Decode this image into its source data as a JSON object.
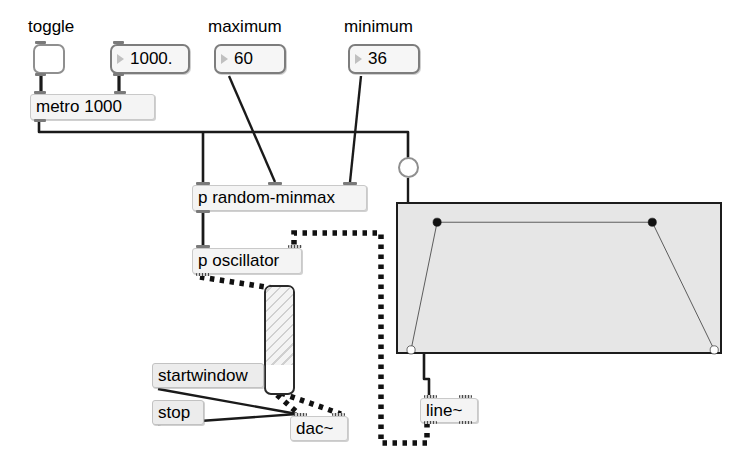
{
  "patch": {
    "title": "Max patch - random oscillator with envelope",
    "width": 744,
    "height": 471,
    "background": "#ffffff"
  },
  "comments": [
    {
      "name": "comment-toggle",
      "text": "toggle",
      "x": 28,
      "y": 18
    },
    {
      "name": "comment-maximum",
      "text": "maximum",
      "x": 208,
      "y": 18
    },
    {
      "name": "comment-minimum",
      "text": "minimum",
      "x": 344,
      "y": 18
    }
  ],
  "objects": {
    "toggle": {
      "label": "toggle",
      "x": 33,
      "y": 44,
      "w": 32,
      "h": 30,
      "state": "off"
    },
    "float_number": {
      "label": "1000.",
      "x": 110,
      "y": 44,
      "w": 80,
      "h": 30
    },
    "maximum": {
      "label": "60",
      "x": 214,
      "y": 44,
      "w": 72,
      "h": 30
    },
    "minimum": {
      "label": "36",
      "x": 348,
      "y": 44,
      "w": 72,
      "h": 30
    },
    "metro": {
      "label": "metro 1000",
      "x": 30,
      "y": 94,
      "w": 125,
      "h": 26
    },
    "bang": {
      "label": "bang",
      "x": 398,
      "y": 157,
      "w": 21,
      "h": 21
    },
    "random_minmax": {
      "label": "p random-minmax",
      "x": 192,
      "y": 185,
      "w": 175,
      "h": 26
    },
    "oscillator": {
      "label": "p oscillator",
      "x": 192,
      "y": 248,
      "w": 110,
      "h": 26
    },
    "gain": {
      "label": "gain~",
      "x": 264,
      "y": 285,
      "w": 31,
      "h": 110,
      "fill_percent": 74
    },
    "startwindow": {
      "label": "startwindow",
      "x": 152,
      "y": 363,
      "w": 112,
      "h": 25
    },
    "stop": {
      "label": "stop",
      "x": 152,
      "y": 400,
      "w": 52,
      "h": 25
    },
    "dac": {
      "label": "dac~",
      "x": 290,
      "y": 416,
      "w": 58,
      "h": 25
    },
    "line": {
      "label": "line~",
      "x": 420,
      "y": 398,
      "w": 58,
      "h": 25
    },
    "function": {
      "label": "function",
      "x": 396,
      "y": 202,
      "w": 326,
      "h": 152
    }
  },
  "chart_data": {
    "type": "line",
    "xlabel": "",
    "ylabel": "",
    "xlim": [
      0,
      100
    ],
    "ylim": [
      0,
      100
    ],
    "grid": false,
    "breakpoints": [
      {
        "x": 4,
        "y": 4,
        "style": "open"
      },
      {
        "x": 12,
        "y": 88,
        "style": "filled"
      },
      {
        "x": 78,
        "y": 88,
        "style": "filled"
      },
      {
        "x": 97,
        "y": 4,
        "style": "open"
      }
    ]
  },
  "connections": {
    "control_cable_color": "#1a1a1a",
    "signal_cable_color": "#111111",
    "signal_style": "dashed-thick"
  }
}
